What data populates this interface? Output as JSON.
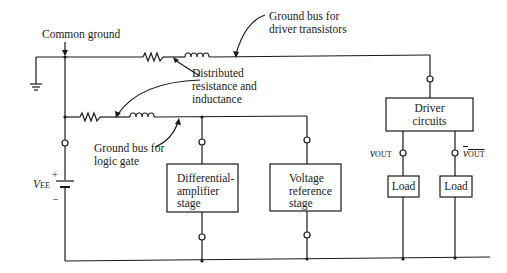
{
  "diagram": {
    "labels": {
      "common_ground": "Common ground",
      "ground_bus_driver_line1": "Ground bus for",
      "ground_bus_driver_line2": "driver transistors",
      "distributed_line1": "Distributed",
      "distributed_line2": "resistance and",
      "distributed_line3": "inductance",
      "ground_bus_logic_line1": "Ground bus for",
      "ground_bus_logic_line2": "logic gate",
      "vee_main": "V",
      "vee_sub": "EE",
      "plus": "+",
      "minus": "–",
      "vout_main": "v",
      "vout_sub": "OUT",
      "voutbar_main": "v",
      "voutbar_sub": "OUT"
    },
    "blocks": {
      "diff_amp": [
        "Differential-",
        "amplifier",
        "stage"
      ],
      "voltage_ref": [
        "Voltage",
        "reference",
        "stage"
      ],
      "driver": [
        "Driver",
        "circuits"
      ],
      "load_1": "Load",
      "load_2": "Load"
    },
    "colors": {
      "line": "#1a1a1a",
      "background": "#ffffff"
    }
  }
}
